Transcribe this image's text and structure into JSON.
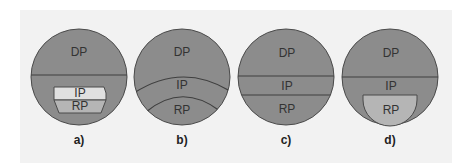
{
  "colors": {
    "background": "#f2f2f2",
    "zone_fill": "#8c8c8c",
    "outline": "#4a4a4a",
    "ip_light": "#e0e0e0",
    "rp_light": "#b5b5b5"
  },
  "panels": [
    {
      "caption": "a)",
      "labels": {
        "dp": "DP",
        "ip": "IP",
        "rp": "RP"
      }
    },
    {
      "caption": "b)",
      "labels": {
        "dp": "DP",
        "ip": "IP",
        "rp": "RP"
      }
    },
    {
      "caption": "c)",
      "labels": {
        "dp": "DP",
        "ip": "IP",
        "rp": "RP"
      }
    },
    {
      "caption": "d)",
      "labels": {
        "dp": "DP",
        "ip": "IP",
        "rp": "RP"
      }
    }
  ]
}
